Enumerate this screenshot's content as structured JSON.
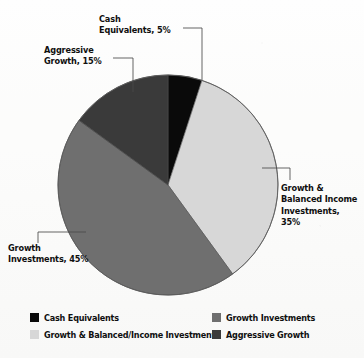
{
  "chart_data": {
    "type": "pie",
    "title": "",
    "categories": [
      "Cash Equivalents",
      "Growth & Balanced Income Investments",
      "Growth Investments",
      "Aggressive Growth"
    ],
    "values": [
      5,
      35,
      45,
      15
    ],
    "units": "%",
    "total": 100,
    "start_angle_deg": 0,
    "direction": "clockwise",
    "legend_position": "bottom",
    "grid": false,
    "colors": [
      "#0a0a0a",
      "#d7d7d7",
      "#6f6f6f",
      "#3a3a3a"
    ],
    "slices": [
      {
        "label": "Cash Equivalents",
        "value": 5,
        "color": "#0a0a0a",
        "start_deg": 0,
        "end_deg": 18
      },
      {
        "label": "Growth & Balanced Income Investments",
        "value": 35,
        "color": "#d7d7d7",
        "start_deg": 18,
        "end_deg": 144
      },
      {
        "label": "Growth Investments",
        "value": 45,
        "color": "#6f6f6f",
        "start_deg": 144,
        "end_deg": 306
      },
      {
        "label": "Aggressive Growth",
        "value": 15,
        "color": "#3a3a3a",
        "start_deg": 306,
        "end_deg": 360
      }
    ]
  },
  "callouts": {
    "cash": "Cash\nEquivalents, 5%",
    "aggressive": "Aggressive\nGrowth, 15%",
    "growth_balanced": "Growth &\nBalanced Income\nInvestments,\n35%",
    "growth": "Growth\nInvestments, 45%"
  },
  "legend": {
    "items": [
      {
        "label": "Cash Equivalents",
        "color": "#0a0a0a"
      },
      {
        "label": "Growth Investments",
        "color": "#6f6f6f"
      },
      {
        "label": "Growth & Balanced/Income Investments",
        "color": "#d7d7d7"
      },
      {
        "label": "Aggressive Growth",
        "color": "#3a3a3a"
      }
    ]
  },
  "style": {
    "pie_outline": "#555555",
    "leader_line": "#4a4a4a",
    "background": "#fcfcfb"
  }
}
